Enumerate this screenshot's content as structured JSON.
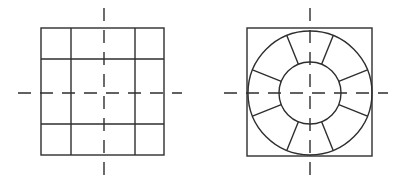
{
  "diagram": {
    "type": "technical-drawing",
    "stroke_color": "#2e2e2e",
    "background_color": "#ffffff",
    "figures": [
      {
        "id": "grid-square",
        "description": "Square divided into a 3x3 grid with wider middle cells, crossed by dashed centerlines",
        "outer_square": {
          "x": 41,
          "y": 28,
          "width": 123,
          "height": 127
        },
        "inner_vertical_lines_x": [
          71,
          135
        ],
        "inner_horizontal_lines_y": [
          59,
          124
        ],
        "centerline_vertical": {
          "x": 104,
          "y1": 8,
          "y2": 178
        },
        "centerline_horizontal": {
          "y": 93,
          "x1": 18,
          "x2": 182
        }
      },
      {
        "id": "ring-square",
        "description": "Square enclosing an annular ring divided into 8 segments by radial spokes, crossed by dashed centerlines",
        "outer_square": {
          "x": 247,
          "y": 28,
          "width": 125,
          "height": 128
        },
        "center": {
          "x": 310,
          "y": 93
        },
        "outer_circle_radius": 62,
        "inner_circle_radius": 31,
        "spoke_count": 8,
        "spoke_angles_deg": [
          22,
          68,
          112,
          158,
          202,
          248,
          292,
          338
        ],
        "centerline_vertical": {
          "x": 310,
          "y1": 8,
          "y2": 178
        },
        "centerline_horizontal": {
          "y": 93,
          "x1": 224,
          "x2": 388
        }
      }
    ]
  }
}
